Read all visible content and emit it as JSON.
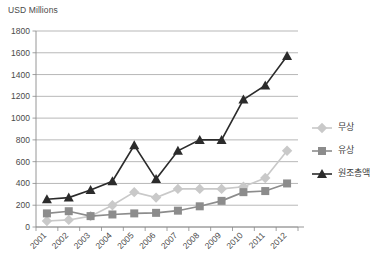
{
  "chart_data": {
    "type": "line",
    "title": "",
    "ylabel": "USD Millions",
    "xlabel": "",
    "ylim": [
      0,
      1800
    ],
    "ytick_step": 200,
    "grid": true,
    "legend_position": "right",
    "categories": [
      "2001",
      "2002",
      "2003",
      "2004",
      "2005",
      "2006",
      "2007",
      "2008",
      "2009",
      "2010",
      "2011",
      "2012"
    ],
    "yticks": [
      "0",
      "200",
      "400",
      "600",
      "800",
      "1000",
      "1200",
      "1400",
      "1600",
      "1800"
    ],
    "series": [
      {
        "name": "무상",
        "color": "#c9c9c9",
        "marker": "diamond",
        "values": [
          55,
          65,
          100,
          200,
          320,
          270,
          350,
          350,
          350,
          370,
          450,
          700
        ]
      },
      {
        "name": "유상",
        "color": "#8c8c8c",
        "marker": "square",
        "values": [
          125,
          145,
          100,
          115,
          125,
          130,
          150,
          190,
          240,
          320,
          330,
          400
        ]
      },
      {
        "name": "원조총액",
        "color": "#2b2b2b",
        "marker": "triangle",
        "values": [
          255,
          270,
          340,
          420,
          750,
          440,
          700,
          800,
          800,
          1170,
          1300,
          1570
        ]
      }
    ]
  },
  "legend": {
    "entries": [
      {
        "label": "무상"
      },
      {
        "label": "유상"
      },
      {
        "label": "원조총액"
      }
    ]
  }
}
